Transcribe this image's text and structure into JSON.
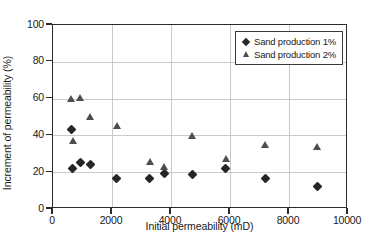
{
  "chart_data": {
    "type": "scatter",
    "title": "",
    "xlabel": "Initial permeability (mD)",
    "ylabel": "Increment of permeability (%)",
    "xlim": [
      0,
      10000
    ],
    "ylim": [
      0,
      100
    ],
    "xticks": [
      0,
      2000,
      4000,
      6000,
      8000,
      10000
    ],
    "yticks": [
      0,
      20,
      40,
      60,
      80,
      100
    ],
    "grid": true,
    "legend_position": "top-right",
    "series": [
      {
        "name": "Sand production 1%",
        "marker": "diamond",
        "color": "#262626",
        "points": [
          [
            660,
            42.5
          ],
          [
            700,
            21.3
          ],
          [
            960,
            24.8
          ],
          [
            1290,
            23.8
          ],
          [
            2190,
            16.3
          ],
          [
            3320,
            15.8
          ],
          [
            3810,
            18.7
          ],
          [
            4760,
            18.0
          ],
          [
            5890,
            21.6
          ],
          [
            7230,
            15.8
          ],
          [
            8990,
            11.7
          ]
        ]
      },
      {
        "name": "Sand production 2%",
        "marker": "triangle",
        "color": "#4d4d4d",
        "points": [
          [
            650,
            59.6
          ],
          [
            700,
            36.4
          ],
          [
            960,
            59.8
          ],
          [
            1300,
            49.9
          ],
          [
            2190,
            44.9
          ],
          [
            3320,
            25.4
          ],
          [
            3810,
            22.5
          ],
          [
            4760,
            39.2
          ],
          [
            5890,
            26.8
          ],
          [
            7230,
            34.5
          ],
          [
            8980,
            33.4
          ]
        ]
      }
    ]
  }
}
